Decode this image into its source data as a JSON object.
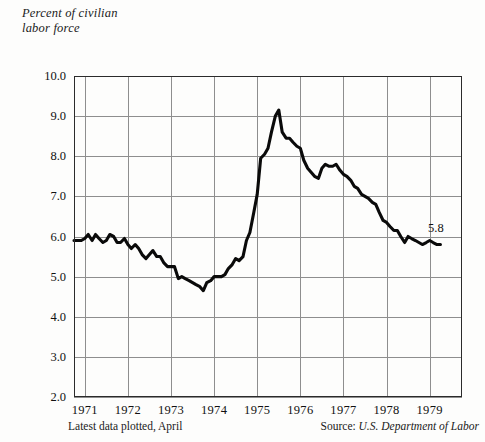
{
  "chart_data": {
    "type": "line",
    "title": "Percent of civilian labor force",
    "title_line1": "Percent of civilian",
    "title_line2": "labor force",
    "xlabel": "",
    "ylabel": "Percent of civilian labor force",
    "ylim": [
      2.0,
      10.0
    ],
    "xlim": [
      1970.75,
      1979.75
    ],
    "grid": true,
    "legend": null,
    "yticks": [
      "10.0",
      "9.0",
      "8.0",
      "7.0",
      "6.0",
      "5.0",
      "4.0",
      "3.0",
      "2.0"
    ],
    "ytick_values": [
      10.0,
      9.0,
      8.0,
      7.0,
      6.0,
      5.0,
      4.0,
      3.0,
      2.0
    ],
    "xticks": [
      "1971",
      "1972",
      "1973",
      "1974",
      "1975",
      "1976",
      "1977",
      "1978",
      "1979"
    ],
    "xtick_values": [
      1971,
      1972,
      1973,
      1974,
      1975,
      1976,
      1977,
      1978,
      1979
    ],
    "series": [
      {
        "name": "Civilian unemployment rate",
        "x": [
          1970.75,
          1970.92,
          1971.0,
          1971.08,
          1971.17,
          1971.25,
          1971.33,
          1971.42,
          1971.5,
          1971.58,
          1971.67,
          1971.75,
          1971.83,
          1971.92,
          1972.0,
          1972.08,
          1972.17,
          1972.25,
          1972.33,
          1972.42,
          1972.5,
          1972.58,
          1972.67,
          1972.75,
          1972.83,
          1972.92,
          1973.0,
          1973.08,
          1973.17,
          1973.25,
          1973.33,
          1973.42,
          1973.5,
          1973.58,
          1973.67,
          1973.75,
          1973.83,
          1973.92,
          1974.0,
          1974.08,
          1974.17,
          1974.25,
          1974.33,
          1974.42,
          1974.5,
          1974.58,
          1974.67,
          1974.75,
          1974.83,
          1974.92,
          1975.0,
          1975.08,
          1975.17,
          1975.25,
          1975.33,
          1975.42,
          1975.5,
          1975.58,
          1975.67,
          1975.75,
          1975.83,
          1975.92,
          1976.0,
          1976.08,
          1976.17,
          1976.25,
          1976.33,
          1976.42,
          1976.5,
          1976.58,
          1976.67,
          1976.75,
          1976.83,
          1976.92,
          1977.0,
          1977.08,
          1977.17,
          1977.25,
          1977.33,
          1977.42,
          1977.5,
          1977.58,
          1977.67,
          1977.75,
          1977.83,
          1977.92,
          1978.0,
          1978.08,
          1978.17,
          1978.25,
          1978.33,
          1978.42,
          1978.5,
          1978.58,
          1978.67,
          1978.75,
          1978.83,
          1978.92,
          1979.0,
          1979.08,
          1979.17,
          1979.25
        ],
        "values": [
          5.9,
          5.9,
          5.95,
          6.05,
          5.9,
          6.05,
          5.95,
          5.85,
          5.9,
          6.05,
          6.0,
          5.85,
          5.85,
          5.95,
          5.8,
          5.7,
          5.8,
          5.7,
          5.55,
          5.45,
          5.55,
          5.65,
          5.5,
          5.5,
          5.35,
          5.25,
          5.25,
          5.25,
          4.95,
          5.0,
          4.95,
          4.9,
          4.85,
          4.8,
          4.75,
          4.65,
          4.85,
          4.9,
          5.0,
          5.0,
          5.0,
          5.05,
          5.2,
          5.3,
          5.45,
          5.4,
          5.5,
          5.9,
          6.1,
          6.6,
          7.05,
          7.95,
          8.05,
          8.2,
          8.6,
          9.0,
          9.15,
          8.6,
          8.45,
          8.45,
          8.35,
          8.25,
          8.2,
          7.9,
          7.7,
          7.6,
          7.5,
          7.45,
          7.7,
          7.8,
          7.75,
          7.75,
          7.8,
          7.65,
          7.55,
          7.5,
          7.4,
          7.25,
          7.2,
          7.05,
          7.0,
          6.95,
          6.85,
          6.8,
          6.6,
          6.4,
          6.35,
          6.25,
          6.15,
          6.15,
          6.0,
          5.85,
          6.0,
          5.95,
          5.9,
          5.85,
          5.8,
          5.85,
          5.9,
          5.85,
          5.8,
          5.8
        ],
        "end_value": "5.8",
        "color": "#0a0a0a"
      }
    ],
    "annotations": [
      {
        "name": "end-value-label",
        "text": "5.8",
        "x": 1979.25,
        "y": 5.8
      }
    ],
    "footnote_left": "Latest data plotted, April",
    "source_prefix": "Source:",
    "source_name": "U.S. Department of Labor"
  }
}
